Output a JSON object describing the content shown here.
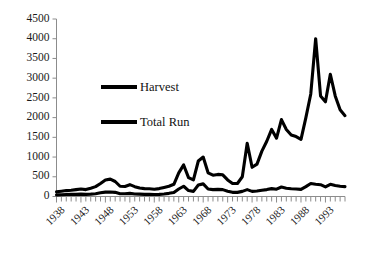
{
  "chart_data": {
    "type": "line",
    "title": "",
    "subtitle": "",
    "xlabel": "",
    "ylabel": "",
    "xlim": [
      1938,
      1997
    ],
    "ylim": [
      0,
      4500
    ],
    "grid": false,
    "legend_position": "upper-left-inside",
    "y_ticks": [
      0,
      500,
      1000,
      1500,
      2000,
      2500,
      3000,
      3500,
      4000,
      4500
    ],
    "y_tick_labels": [
      "0",
      "500",
      "1000",
      "1500",
      "2000",
      "2500",
      "3000",
      "3500",
      "4000",
      "4500"
    ],
    "x_tick_labels": [
      "1938",
      "1943",
      "1948",
      "1953",
      "1958",
      "1963",
      "1968",
      "1973",
      "1978",
      "1983",
      "1988",
      "1993"
    ],
    "x_tick_values": [
      1938,
      1943,
      1948,
      1953,
      1958,
      1963,
      1968,
      1973,
      1978,
      1983,
      1988,
      1993
    ],
    "x_minor_ticks_every": 1,
    "x": [
      1938,
      1939,
      1940,
      1941,
      1942,
      1943,
      1944,
      1945,
      1946,
      1947,
      1948,
      1949,
      1950,
      1951,
      1952,
      1953,
      1954,
      1955,
      1956,
      1957,
      1958,
      1959,
      1960,
      1961,
      1962,
      1963,
      1964,
      1965,
      1966,
      1967,
      1968,
      1969,
      1970,
      1971,
      1972,
      1973,
      1974,
      1975,
      1976,
      1977,
      1978,
      1979,
      1980,
      1981,
      1982,
      1983,
      1984,
      1985,
      1986,
      1987,
      1988,
      1989,
      1990,
      1991,
      1992,
      1993,
      1994,
      1995,
      1996,
      1997
    ],
    "series": [
      {
        "name": "Total Run",
        "color": "#000000",
        "values": [
          120,
          135,
          150,
          160,
          175,
          190,
          175,
          210,
          250,
          330,
          420,
          440,
          380,
          260,
          255,
          300,
          250,
          215,
          200,
          195,
          185,
          200,
          230,
          260,
          310,
          600,
          800,
          480,
          420,
          900,
          1000,
          600,
          540,
          560,
          550,
          420,
          330,
          330,
          500,
          1350,
          740,
          820,
          1150,
          1400,
          1700,
          1480,
          1950,
          1700,
          1560,
          1520,
          1450,
          2000,
          2600,
          4000,
          2550,
          2400,
          3100,
          2550,
          2200,
          2050
        ]
      },
      {
        "name": "Harvest",
        "color": "#000000",
        "values": [
          40,
          45,
          50,
          55,
          55,
          60,
          55,
          60,
          70,
          95,
          110,
          115,
          105,
          70,
          70,
          80,
          65,
          60,
          55,
          55,
          50,
          55,
          65,
          80,
          100,
          190,
          260,
          150,
          130,
          290,
          320,
          190,
          175,
          180,
          175,
          135,
          105,
          105,
          130,
          175,
          130,
          140,
          160,
          175,
          200,
          185,
          240,
          210,
          195,
          190,
          180,
          250,
          330,
          310,
          300,
          245,
          310,
          280,
          260,
          250
        ]
      }
    ],
    "legend_entries": [
      {
        "label": "Harvest",
        "color": "#000000"
      },
      {
        "label": "Total Run",
        "color": "#000000"
      }
    ],
    "axis_color": "#8c8c8c",
    "line_color": "#000000"
  }
}
